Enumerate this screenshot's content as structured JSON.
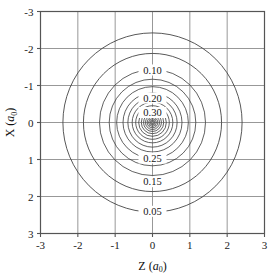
{
  "figure": {
    "background_color": "#ffffff",
    "frame_color": "#555555",
    "grid_color": "#8c8c8c",
    "contour_color": "#3a3a3a",
    "text_color": "#151515"
  },
  "axes": {
    "x_title_main": "Z",
    "x_title_paren_open": "(",
    "x_title_symbol": "a",
    "x_title_sub": "0",
    "x_title_paren_close": ")",
    "y_title_main": "X",
    "y_title_paren_open": "(",
    "y_title_symbol": "a",
    "y_title_sub": "0",
    "y_title_paren_close": ")",
    "x_ticks": [
      "-3",
      "-2",
      "-1",
      "0",
      "1",
      "2",
      "3"
    ],
    "y_ticks": [
      "3",
      "2",
      "1",
      "0",
      "-1",
      "-2",
      "-3"
    ]
  },
  "chart_data": {
    "type": "contour",
    "title": "",
    "xlabel": "Z (a0)",
    "ylabel": "X (a0)",
    "xlim": [
      -3,
      3
    ],
    "ylim": [
      -3,
      3
    ],
    "xticks": [
      -3,
      -2,
      -1,
      0,
      1,
      2,
      3
    ],
    "yticks": [
      -3,
      -2,
      -1,
      0,
      1,
      2,
      3
    ],
    "grid": true,
    "legend": "none",
    "center": [
      0,
      0
    ],
    "contour_shape": "concentric-circles",
    "units": "Bohr radii (a0)",
    "labeled_levels": [
      0.05,
      0.1,
      0.15,
      0.2,
      0.25,
      0.3
    ],
    "contours": [
      {
        "level": 0.05,
        "radius": 2.4,
        "labeled": true,
        "label": "0.05",
        "label_side": "below"
      },
      {
        "level": null,
        "radius": 1.85,
        "labeled": false,
        "label": "",
        "label_side": ""
      },
      {
        "level": 0.1,
        "radius": 1.42,
        "labeled": true,
        "label": "0.10",
        "label_side": "above"
      },
      {
        "level": null,
        "radius": 1.16,
        "labeled": false,
        "label": "",
        "label_side": ""
      },
      {
        "level": 0.15,
        "radius": 0.96,
        "labeled": true,
        "label": "0.15",
        "label_side": "below"
      },
      {
        "level": null,
        "radius": 0.79,
        "labeled": false,
        "label": "",
        "label_side": ""
      },
      {
        "level": 0.2,
        "radius": 0.66,
        "labeled": true,
        "label": "0.20",
        "label_side": "above"
      },
      {
        "level": null,
        "radius": 0.545,
        "labeled": false,
        "label": "",
        "label_side": ""
      },
      {
        "level": null,
        "radius": 0.45,
        "labeled": false,
        "label": "",
        "label_side": ""
      },
      {
        "level": null,
        "radius": 0.37,
        "labeled": false,
        "label": "",
        "label_side": ""
      },
      {
        "level": 0.25,
        "radius": 0.3,
        "labeled": true,
        "label": "0.25",
        "label_side": "below"
      },
      {
        "level": null,
        "radius": 0.24,
        "labeled": false,
        "label": "",
        "label_side": ""
      },
      {
        "level": null,
        "radius": 0.188,
        "labeled": false,
        "label": "",
        "label_side": ""
      },
      {
        "level": null,
        "radius": 0.143,
        "labeled": false,
        "label": "",
        "label_side": ""
      },
      {
        "level": 0.3,
        "radius": 0.104,
        "labeled": true,
        "label": "0.30",
        "label_side": "above"
      },
      {
        "level": null,
        "radius": 0.068,
        "labeled": false,
        "label": "",
        "label_side": ""
      },
      {
        "level": null,
        "radius": 0.036,
        "labeled": false,
        "label": "",
        "label_side": ""
      }
    ],
    "contour_labels": [
      {
        "text": "0.10",
        "x": 0.0,
        "y": 1.42
      },
      {
        "text": "0.20",
        "x": 0.0,
        "y": 0.66
      },
      {
        "text": "0.30",
        "x": 0.0,
        "y": 0.27
      },
      {
        "text": "0.25",
        "x": 0.0,
        "y": -0.96
      },
      {
        "text": "0.15",
        "x": 0.0,
        "y": -1.6
      },
      {
        "text": "0.05",
        "x": 0.0,
        "y": -2.4
      }
    ]
  }
}
